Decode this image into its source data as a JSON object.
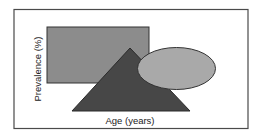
{
  "diagram": {
    "xlabel": "Age (years)",
    "ylabel": "Prevalence (%)",
    "shapes": [
      {
        "kind": "rectangle",
        "fill": "#8c8c8c"
      },
      {
        "kind": "triangle",
        "fill": "#474747"
      },
      {
        "kind": "ellipse",
        "fill": "#a9a9a9"
      }
    ],
    "colors": {
      "frame": "#4a4a4a",
      "background": "#ffffff",
      "outline": "#2e2e2e"
    }
  }
}
